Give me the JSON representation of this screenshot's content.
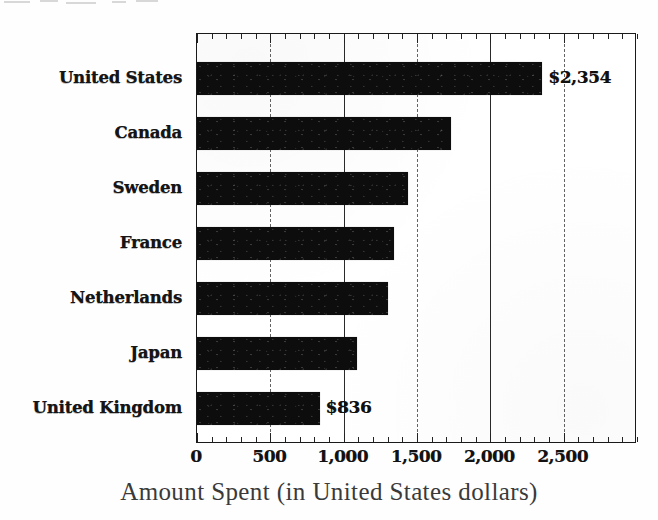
{
  "chart_data": {
    "type": "bar",
    "orientation": "horizontal",
    "title": "",
    "xlabel": "Amount Spent (in United States dollars)",
    "ylabel": "",
    "categories": [
      "United States",
      "Canada",
      "Sweden",
      "France",
      "Netherlands",
      "Japan",
      "United Kingdom"
    ],
    "values": [
      2354,
      1730,
      1440,
      1340,
      1300,
      1090,
      836
    ],
    "value_labels": [
      "$2,354",
      "",
      "",
      "",
      "",
      "",
      "$836"
    ],
    "xlim": [
      0,
      3000
    ],
    "xticks": [
      0,
      500,
      1000,
      1500,
      2000,
      2500
    ],
    "xticklabels": [
      "0",
      "500",
      "1,000",
      "1,500",
      "2,000",
      "2,500"
    ],
    "minor_tick_interval": 100,
    "grid": true,
    "grid_axis": "x",
    "legend": null,
    "bar_color": "#0d0d0d",
    "frame_color": "#1a1a1a"
  },
  "axis": {
    "x_title": "Amount Spent (in United States dollars)"
  }
}
